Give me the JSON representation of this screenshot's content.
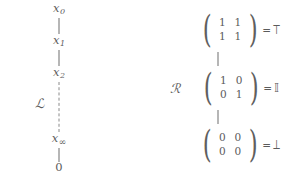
{
  "figure": {
    "width": 297,
    "height": 177,
    "background_color": "#ffffff",
    "ink_color": "#5b5b5b",
    "line_color": "#6e6e6e"
  },
  "left_chain": {
    "label": "ℒ",
    "label_name": "script-L",
    "nodes": [
      {
        "base": "x",
        "sub": "0",
        "text": "x₀",
        "x": 59,
        "y": 10
      },
      {
        "base": "x",
        "sub": "1",
        "text": "x₁",
        "x": 59,
        "y": 42
      },
      {
        "base": "x",
        "sub": "2",
        "text": "x₂",
        "x": 59,
        "y": 74
      },
      {
        "base": "x",
        "sub": "∞",
        "text": "x∞",
        "x": 59,
        "y": 140
      },
      {
        "base": "0",
        "sub": "",
        "text": "0",
        "x": 59,
        "y": 168
      }
    ],
    "connectors": [
      {
        "style": "solid",
        "x": 59,
        "y1": 18,
        "y2": 34
      },
      {
        "style": "solid",
        "x": 59,
        "y1": 50,
        "y2": 66
      },
      {
        "style": "dashed",
        "x": 59,
        "y1": 82,
        "y2": 132
      },
      {
        "style": "solid",
        "x": 59,
        "y1": 148,
        "y2": 162
      }
    ]
  },
  "right_chain": {
    "label": "ℛ",
    "label_name": "script-R",
    "equals": "=",
    "matrices": [
      {
        "name": "top-matrix",
        "rows": [
          [
            "1",
            "1"
          ],
          [
            "1",
            "1"
          ]
        ],
        "result_symbol": "⟙",
        "result_name": "double-struck-top",
        "x": 240,
        "y": 30
      },
      {
        "name": "identity-matrix",
        "rows": [
          [
            "1",
            "0"
          ],
          [
            "0",
            "1"
          ]
        ],
        "result_symbol": "𝕀",
        "result_name": "double-struck-I",
        "x": 240,
        "y": 88
      },
      {
        "name": "bottom-matrix",
        "rows": [
          [
            "0",
            "0"
          ],
          [
            "0",
            "0"
          ]
        ],
        "result_symbol": "⟘",
        "result_name": "double-struck-bottom",
        "x": 240,
        "y": 145
      }
    ],
    "connectors": [
      {
        "style": "solid",
        "x": 218,
        "y1": 52,
        "y2": 66
      },
      {
        "style": "solid",
        "x": 218,
        "y1": 110,
        "y2": 124
      }
    ]
  }
}
